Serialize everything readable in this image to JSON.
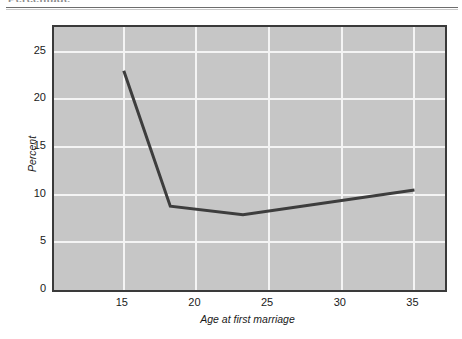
{
  "scan": {
    "header_text_cropped": "Percentage",
    "rule": "horizontal-rule"
  },
  "chart_data": {
    "type": "line",
    "title": "",
    "xlabel": "Age at first marriage",
    "ylabel": "Percent",
    "xlim": [
      10.2,
      37.1
    ],
    "ylim": [
      0,
      27.6
    ],
    "grid": true,
    "legend": "none",
    "x_ticks": [
      15,
      20,
      25,
      30,
      35
    ],
    "x_tick_labels": [
      "15",
      "20",
      "25",
      "30",
      "35"
    ],
    "y_ticks": [
      0,
      5,
      10,
      15,
      20,
      25
    ],
    "y_tick_labels": [
      "0",
      "5",
      "10",
      "15",
      "20",
      "25"
    ],
    "series": [
      {
        "name": "Percent divorced by age at first marriage",
        "color": "#3d3d3d",
        "line_width": 3,
        "x": [
          15,
          18.2,
          23.2,
          35
        ],
        "values": [
          23.0,
          8.8,
          7.9,
          10.5
        ],
        "points": [
          {
            "x": 15,
            "y": 23.0
          },
          {
            "x": 18.2,
            "y": 8.8
          },
          {
            "x": 23.2,
            "y": 7.9
          },
          {
            "x": 35,
            "y": 10.5
          }
        ]
      }
    ]
  },
  "style": {
    "plot_background": "#c6c6c6",
    "gridline_color": "#f4f4f4",
    "frame_color": "#3a3a3a",
    "series_color": "#3d3d3d",
    "text_color": "#1a1a1a",
    "page_background": "#ffffff"
  }
}
